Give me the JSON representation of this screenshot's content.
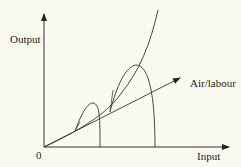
{
  "diagram": {
    "y_axis_label": "Output",
    "x_axis_label": "Input",
    "origin_label": "0",
    "ray_label": "Air/labour",
    "colors": {
      "background": "#fbfaf0",
      "stroke": "#333333",
      "text": "#222222"
    },
    "elements": [
      {
        "type": "axis",
        "name": "y-axis",
        "direction": "up",
        "arrow": true
      },
      {
        "type": "axis",
        "name": "x-axis",
        "direction": "right",
        "arrow": true
      },
      {
        "type": "ray",
        "name": "air-labour-ray",
        "from": "origin",
        "arrow": true,
        "label": "Air/labour"
      },
      {
        "type": "curve",
        "name": "exponential-output-curve",
        "shape": "convex rising from origin"
      },
      {
        "type": "loop",
        "name": "small-loop",
        "description": "hump between ray and curve, dropping vertically to input axis"
      },
      {
        "type": "loop",
        "name": "large-loop",
        "description": "larger hump between ray and curve, dropping vertically to input axis"
      }
    ]
  }
}
